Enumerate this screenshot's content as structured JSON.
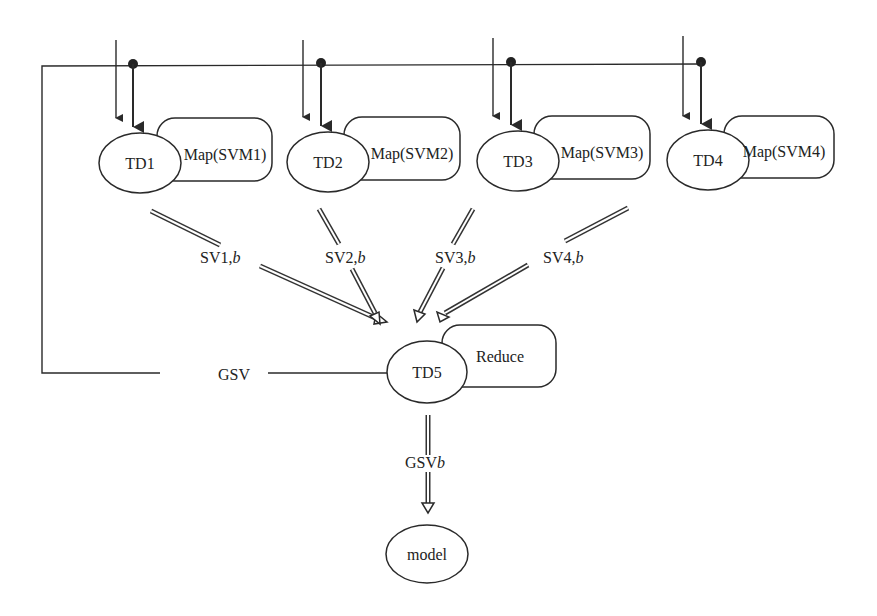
{
  "diagram": {
    "mappers": [
      {
        "node": "TD1",
        "task": "Map(SVM1)",
        "output": "SV1,",
        "output_suffix": "b"
      },
      {
        "node": "TD2",
        "task": "Map(SVM2)",
        "output": "SV2,",
        "output_suffix": "b"
      },
      {
        "node": "TD3",
        "task": "Map(SVM3)",
        "output": "SV3,",
        "output_suffix": "b"
      },
      {
        "node": "TD4",
        "task": "Map(SVM4)",
        "output": "SV4,",
        "output_suffix": "b"
      }
    ],
    "reducer": {
      "node": "TD5",
      "task": "Reduce"
    },
    "feedback_label": "GSV",
    "final_output": {
      "label": "GSV",
      "suffix": "b"
    },
    "result": {
      "node": "model"
    },
    "colors": {
      "stroke": "#2a2a2a",
      "background": "#ffffff"
    }
  }
}
